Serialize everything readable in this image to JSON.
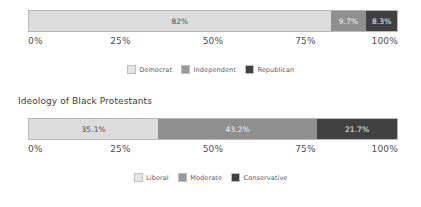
{
  "chart_data": [
    {
      "type": "bar",
      "orientation": "horizontal",
      "stacked": true,
      "title": "",
      "xlabel": "",
      "ylabel": "",
      "xlim": [
        0,
        100
      ],
      "grid": false,
      "legend_position": "bottom-center",
      "categories": [
        ""
      ],
      "tick_labels": [
        "0%",
        "25%",
        "50%",
        "75%",
        "100%"
      ],
      "tick_values": [
        0,
        25,
        50,
        75,
        100
      ],
      "series": [
        {
          "name": "Democrat",
          "values": [
            82
          ],
          "label": "82%",
          "color": "#dcdcdc"
        },
        {
          "name": "Independent",
          "values": [
            9.7
          ],
          "label": "9.7%",
          "color": "#8f8f8f"
        },
        {
          "name": "Republican",
          "values": [
            8.3
          ],
          "label": "8.3%",
          "color": "#414141"
        }
      ]
    },
    {
      "type": "bar",
      "orientation": "horizontal",
      "stacked": true,
      "title": "Ideology of Black Protestants",
      "xlabel": "",
      "ylabel": "",
      "xlim": [
        0,
        100
      ],
      "grid": false,
      "legend_position": "bottom-center",
      "categories": [
        ""
      ],
      "tick_labels": [
        "0%",
        "25%",
        "50%",
        "75%",
        "100%"
      ],
      "tick_values": [
        0,
        25,
        50,
        75,
        100
      ],
      "series": [
        {
          "name": "Liberal",
          "values": [
            35.1
          ],
          "label": "35.1%",
          "color": "#dcdcdc"
        },
        {
          "name": "Moderate",
          "values": [
            43.2
          ],
          "label": "43.2%",
          "color": "#8f8f8f"
        },
        {
          "name": "Conservative",
          "values": [
            21.7
          ],
          "label": "21.7%",
          "color": "#414141"
        }
      ]
    }
  ],
  "charts": [
    {
      "title": "",
      "segments": [
        {
          "label": "82%",
          "name": "Democrat"
        },
        {
          "label": "9.7%",
          "name": "Independent"
        },
        {
          "label": "8.3%",
          "name": "Republican"
        }
      ],
      "ticks": [
        "0%",
        "25%",
        "50%",
        "75%",
        "100%"
      ],
      "legend": [
        "Democrat",
        "Independent",
        "Republican"
      ]
    },
    {
      "title": "Ideology of Black Protestants",
      "segments": [
        {
          "label": "35.1%",
          "name": "Liberal"
        },
        {
          "label": "43.2%",
          "name": "Moderate"
        },
        {
          "label": "21.7%",
          "name": "Conservative"
        }
      ],
      "ticks": [
        "0%",
        "25%",
        "50%",
        "75%",
        "100%"
      ],
      "legend": [
        "Liberal",
        "Moderate",
        "Conservative"
      ]
    }
  ],
  "colors": {
    "light": "#dcdcdc",
    "medium": "#8f8f8f",
    "dark": "#414141",
    "text": "#4f4f4f",
    "background": "#ffffff"
  }
}
